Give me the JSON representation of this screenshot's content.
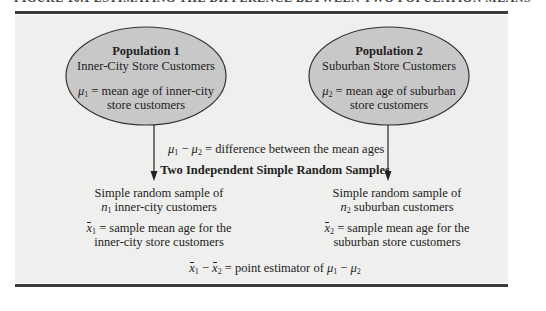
{
  "figure": {
    "cut_title": "FIGURE 10.1  ESTIMATING THE DIFFERENCE BETWEEN TWO POPULATION MEANS",
    "colors": {
      "panel_background": "#efefed",
      "ellipse_fill": "#c8c8c8",
      "ellipse_stroke": "#333333",
      "rule": "#3a3a3a",
      "text": "#222222"
    }
  },
  "population1": {
    "title": "Population 1",
    "subtitle": "Inner-City Store Customers",
    "symbol": "μ",
    "symbol_sub": "1",
    "definition_line1": " = mean age of inner-city",
    "definition_line2": "store customers"
  },
  "population2": {
    "title": "Population 2",
    "subtitle": "Suburban Store Customers",
    "symbol": "μ",
    "symbol_sub": "2",
    "definition_line1": " = mean age of suburban",
    "definition_line2": "store customers"
  },
  "difference": {
    "mu": "μ",
    "sub1": "1",
    "minus": " − ",
    "sub2": "2",
    "text": " = difference between the mean ages"
  },
  "samples_heading": "Two Independent Simple Random Samples",
  "sample1": {
    "line1": "Simple random sample of",
    "n_symbol": "n",
    "n_sub": "1",
    "line2_rest": " inner-city customers",
    "xbar_symbol": "x",
    "xbar_sub": "1",
    "def_line1": " = sample mean age for the",
    "def_line2": "inner-city store customers"
  },
  "sample2": {
    "line1": "Simple random sample of",
    "n_symbol": "n",
    "n_sub": "2",
    "line2_rest": " suburban customers",
    "xbar_symbol": "x",
    "xbar_sub": "2",
    "def_line1": " = sample mean age for the",
    "def_line2": "suburban store customers"
  },
  "estimator": {
    "x": "x",
    "sub1": "1",
    "minus": " − ",
    "sub2": "2",
    "text": " = point estimator of ",
    "mu": "μ",
    "mu_sub1": "1",
    "mu_minus": " − ",
    "mu_sub2": "2"
  }
}
